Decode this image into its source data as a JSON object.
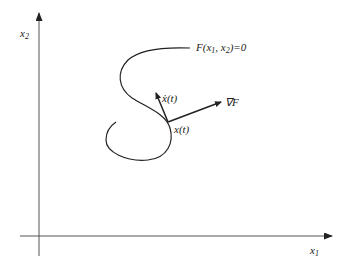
{
  "diagram": {
    "axes": {
      "x_label": "x",
      "x_label_sub": "1",
      "y_label": "x",
      "y_label_sub": "2"
    },
    "curve_label": {
      "prefix": "F(x",
      "sub1": "1",
      "mid": ", x",
      "sub2": "2",
      "suffix": ")=0"
    },
    "point_label": "x(t)",
    "velocity_label": "ẋ(t)",
    "gradient_label": "∇F",
    "colors": {
      "stroke": "#222222",
      "axis": "#555555",
      "background": "#ffffff"
    }
  }
}
